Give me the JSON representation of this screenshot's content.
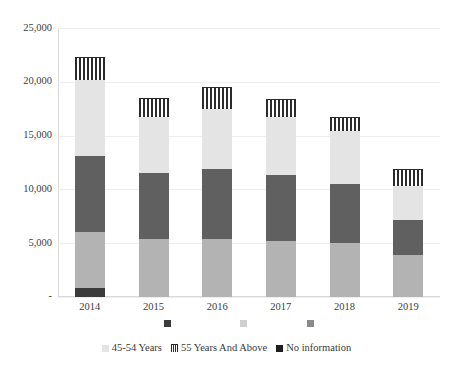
{
  "chart_data": {
    "type": "bar",
    "subtype": "stacked-bar",
    "title": "",
    "subtitle": "",
    "xlabel": "",
    "ylabel": "",
    "grid": true,
    "legend_position": "bottom",
    "categories": [
      "2014",
      "2015",
      "2016",
      "2017",
      "2018",
      "2019"
    ],
    "ylim": [
      0,
      25000
    ],
    "yticks": [
      0,
      5000,
      10000,
      15000,
      20000,
      25000
    ],
    "ytick_labels": [
      "-",
      "5,000",
      "10,000",
      "15,000",
      "20,000",
      "25,000"
    ],
    "series": [
      {
        "name": "No information",
        "color": "#3b3b3b",
        "values": [
          800,
          0,
          0,
          0,
          0,
          0
        ]
      },
      {
        "name": "25-34 Years",
        "color": "#b3b3b3",
        "values": [
          5200,
          5400,
          5400,
          5200,
          5000,
          3900
        ]
      },
      {
        "name": "35-44 Years",
        "color": "#606060",
        "values": [
          7100,
          6100,
          6500,
          6100,
          5500,
          3300
        ]
      },
      {
        "name": "45-54 Years",
        "color": "#e4e4e4",
        "values": [
          7100,
          5200,
          5600,
          5400,
          4900,
          3100
        ]
      },
      {
        "name": "55 Years And Above",
        "color": "#2b2b2b",
        "pattern": "vertical-stripes",
        "values": [
          2100,
          1800,
          2000,
          1700,
          1300,
          1600
        ]
      }
    ],
    "totals": [
      22300,
      18500,
      19500,
      18400,
      16700,
      11900
    ],
    "legend_entries": [
      {
        "label": "45-54 Years",
        "swatch": "light-gray"
      },
      {
        "label": "55 Years And Above",
        "swatch": "vertical-stripes"
      },
      {
        "label": "No information",
        "swatch": "black"
      }
    ],
    "partial_markers": [
      {
        "color": "#3b3b3b"
      },
      {
        "color": "#d0d0d0"
      },
      {
        "color": "#8a8a8a"
      }
    ]
  }
}
